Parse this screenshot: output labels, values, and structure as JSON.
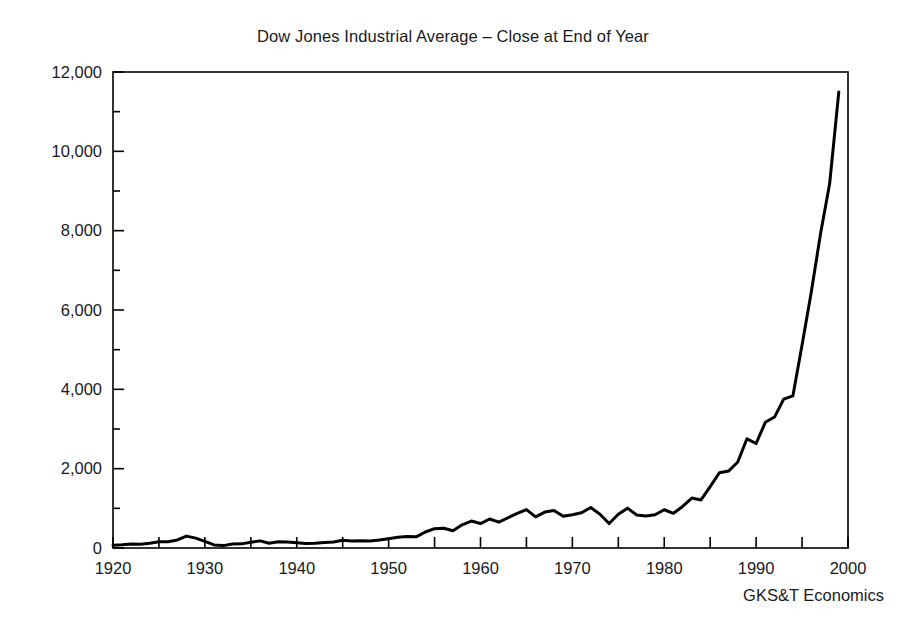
{
  "chart_data": {
    "type": "line",
    "title": "Dow Jones Industrial Average – Close at End of Year",
    "source": "GKS&T Economics",
    "xlabel": "",
    "ylabel": "",
    "xlim": [
      1920,
      2000
    ],
    "ylim": [
      0,
      12000
    ],
    "grid": false,
    "legend": false,
    "legend_position": "none",
    "x_tick_labels": [
      "1920",
      "1930",
      "1940",
      "1950",
      "1960",
      "1970",
      "1980",
      "1990",
      "2000"
    ],
    "x_tick_values": [
      1920,
      1930,
      1940,
      1950,
      1960,
      1970,
      1980,
      1990,
      2000
    ],
    "x_minor_tick_values": [
      1925,
      1935,
      1945,
      1955,
      1965,
      1975,
      1985,
      1995
    ],
    "y_tick_labels": [
      "0",
      "2,000",
      "4,000",
      "6,000",
      "8,000",
      "10,000",
      "12,000"
    ],
    "y_tick_values": [
      0,
      2000,
      4000,
      6000,
      8000,
      10000,
      12000
    ],
    "y_minor_tick_values": [
      1000,
      3000,
      5000,
      7000,
      9000,
      11000
    ],
    "line_color": "#000000",
    "line_width": 3,
    "series": [
      {
        "name": "Dow Jones Industrial Average",
        "x": [
          1920,
          1921,
          1922,
          1923,
          1924,
          1925,
          1926,
          1927,
          1928,
          1929,
          1930,
          1931,
          1932,
          1933,
          1934,
          1935,
          1936,
          1937,
          1938,
          1939,
          1940,
          1941,
          1942,
          1943,
          1944,
          1945,
          1946,
          1947,
          1948,
          1949,
          1950,
          1951,
          1952,
          1953,
          1954,
          1955,
          1956,
          1957,
          1958,
          1959,
          1960,
          1961,
          1962,
          1963,
          1964,
          1965,
          1966,
          1967,
          1968,
          1969,
          1970,
          1971,
          1972,
          1973,
          1974,
          1975,
          1976,
          1977,
          1978,
          1979,
          1980,
          1981,
          1982,
          1983,
          1984,
          1985,
          1986,
          1987,
          1988,
          1989,
          1990,
          1991,
          1992,
          1993,
          1994,
          1995,
          1996,
          1997,
          1998,
          1999
        ],
        "values": [
          72,
          81,
          99,
          95,
          120,
          156,
          157,
          202,
          300,
          248,
          165,
          77,
          60,
          99,
          104,
          144,
          180,
          121,
          155,
          150,
          131,
          111,
          119,
          136,
          152,
          193,
          177,
          181,
          177,
          200,
          235,
          269,
          292,
          281,
          404,
          488,
          499,
          436,
          584,
          679,
          616,
          731,
          652,
          763,
          874,
          969,
          786,
          905,
          944,
          800,
          839,
          890,
          1020,
          851,
          616,
          852,
          1005,
          831,
          805,
          839,
          964,
          875,
          1047,
          1259,
          1212,
          1547,
          1896,
          1939,
          2169,
          2753,
          2634,
          3169,
          3301,
          3754,
          3834,
          5117,
          6448,
          7908,
          9181,
          11497
        ]
      }
    ],
    "annotations": []
  },
  "figure": {
    "title_text": "Dow Jones Industrial Average – Close at End of Year",
    "source_text": "GKS&T Economics"
  }
}
